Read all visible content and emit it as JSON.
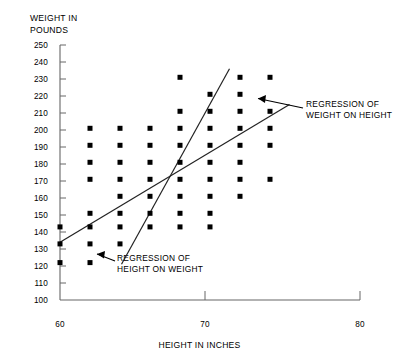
{
  "figure": {
    "name": "scatter-plot-height-weight-regression",
    "background": "#ffffff",
    "ink_color": "#000000",
    "axis_color": "#555555",
    "width": 407,
    "height": 360
  },
  "chart_data": {
    "type": "scatter",
    "title": "",
    "xlabel": "HEIGHT IN INCHES",
    "ylabel": "WEIGHT IN\nPOUNDS",
    "ylabel_line1": "WEIGHT IN",
    "ylabel_line2": "POUNDS",
    "xlim": [
      60,
      80
    ],
    "ylim": [
      100,
      250
    ],
    "xticks": [
      60,
      70,
      80
    ],
    "xtick_labels": [
      "60",
      "70",
      "80"
    ],
    "yticks": [
      100,
      110,
      120,
      130,
      140,
      150,
      160,
      170,
      180,
      190,
      200,
      210,
      220,
      230,
      240,
      250
    ],
    "ytick_labels": [
      "100",
      "110",
      "120",
      "130",
      "140",
      "150",
      "160",
      "170",
      "180",
      "190",
      "200",
      "210",
      "220",
      "230",
      "240",
      "250"
    ],
    "grid": false,
    "legend": null,
    "marker": "filled-square",
    "marker_size_px": 5,
    "points": [
      {
        "x": 60,
        "y": 143
      },
      {
        "x": 60,
        "y": 133
      },
      {
        "x": 60,
        "y": 122
      },
      {
        "x": 62,
        "y": 201
      },
      {
        "x": 62,
        "y": 191
      },
      {
        "x": 62,
        "y": 181
      },
      {
        "x": 62,
        "y": 171
      },
      {
        "x": 62,
        "y": 151
      },
      {
        "x": 62,
        "y": 143
      },
      {
        "x": 62,
        "y": 133
      },
      {
        "x": 62,
        "y": 122
      },
      {
        "x": 64,
        "y": 201
      },
      {
        "x": 64,
        "y": 191
      },
      {
        "x": 64,
        "y": 181
      },
      {
        "x": 64,
        "y": 171
      },
      {
        "x": 64,
        "y": 161
      },
      {
        "x": 64,
        "y": 151
      },
      {
        "x": 64,
        "y": 143
      },
      {
        "x": 64,
        "y": 133
      },
      {
        "x": 66,
        "y": 201
      },
      {
        "x": 66,
        "y": 191
      },
      {
        "x": 66,
        "y": 181
      },
      {
        "x": 66,
        "y": 171
      },
      {
        "x": 66,
        "y": 161
      },
      {
        "x": 66,
        "y": 151
      },
      {
        "x": 66,
        "y": 143
      },
      {
        "x": 68,
        "y": 231
      },
      {
        "x": 68,
        "y": 211
      },
      {
        "x": 68,
        "y": 201
      },
      {
        "x": 68,
        "y": 191
      },
      {
        "x": 68,
        "y": 181
      },
      {
        "x": 68,
        "y": 171
      },
      {
        "x": 68,
        "y": 161
      },
      {
        "x": 68,
        "y": 151
      },
      {
        "x": 68,
        "y": 143
      },
      {
        "x": 70,
        "y": 221
      },
      {
        "x": 70,
        "y": 211
      },
      {
        "x": 70,
        "y": 201
      },
      {
        "x": 70,
        "y": 191
      },
      {
        "x": 70,
        "y": 181
      },
      {
        "x": 70,
        "y": 171
      },
      {
        "x": 70,
        "y": 161
      },
      {
        "x": 70,
        "y": 151
      },
      {
        "x": 70,
        "y": 143
      },
      {
        "x": 72,
        "y": 231
      },
      {
        "x": 72,
        "y": 221
      },
      {
        "x": 72,
        "y": 211
      },
      {
        "x": 72,
        "y": 201
      },
      {
        "x": 72,
        "y": 191
      },
      {
        "x": 72,
        "y": 181
      },
      {
        "x": 72,
        "y": 171
      },
      {
        "x": 72,
        "y": 161
      },
      {
        "x": 74,
        "y": 231
      },
      {
        "x": 74,
        "y": 211
      },
      {
        "x": 74,
        "y": 201
      },
      {
        "x": 74,
        "y": 191
      },
      {
        "x": 74,
        "y": 171
      }
    ],
    "lines": [
      {
        "name": "regression-of-weight-on-height",
        "label": "REGRESSION OF\nWEIGHT ON HEIGHT",
        "label_line1": "REGRESSION OF",
        "label_line2": "WEIGHT ON HEIGHT",
        "x_start": 60,
        "y_start": 134,
        "x_end": 75.3,
        "y_end": 215
      },
      {
        "name": "regression-of-height-on-weight",
        "label": "REGRESSION OF\nHEIGHT ON WEIGHT",
        "label_line1": "REGRESSION OF",
        "label_line2": "HEIGHT ON WEIGHT",
        "x_start": 64.1,
        "y_start": 121,
        "x_end": 71.3,
        "y_end": 236
      }
    ],
    "annotations": [
      {
        "name": "annotation-weight-on-height",
        "text_line1": "REGRESSION OF",
        "text_line2": "WEIGHT ON HEIGHT",
        "arrow_from": [
          304,
          108
        ],
        "arrow_to": [
          253,
          97
        ]
      },
      {
        "name": "annotation-height-on-weight",
        "text_line1": "REGRESSION OF",
        "text_line2": "HEIGHT ON WEIGHT",
        "arrow_from": [
          115,
          262
        ],
        "arrow_to": [
          93,
          253
        ]
      }
    ]
  }
}
